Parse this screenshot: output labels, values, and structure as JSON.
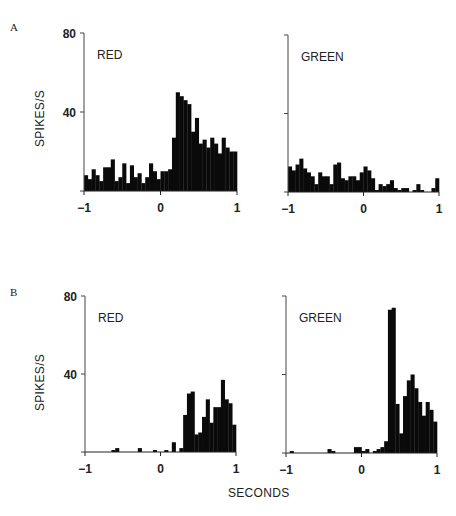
{
  "figure": {
    "panel_labels": [
      "A",
      "B"
    ],
    "ylabel": "SPIKES/S",
    "xlabel": "SECONDS"
  },
  "chart_data": [
    {
      "type": "bar",
      "panel": "A",
      "title": "RED",
      "xlabel": "",
      "ylabel": "SPIKES/S",
      "xlim": [
        -1,
        1
      ],
      "ylim": [
        0,
        80
      ],
      "xticks": [
        "-1",
        "0",
        "1"
      ],
      "yticks": [
        "80",
        "40"
      ],
      "bin_width": 0.05,
      "x": [
        -1.0,
        -0.95,
        -0.9,
        -0.85,
        -0.8,
        -0.75,
        -0.7,
        -0.65,
        -0.6,
        -0.55,
        -0.5,
        -0.45,
        -0.4,
        -0.35,
        -0.3,
        -0.25,
        -0.2,
        -0.15,
        -0.1,
        -0.05,
        0.0,
        0.05,
        0.1,
        0.15,
        0.2,
        0.25,
        0.3,
        0.35,
        0.4,
        0.45,
        0.5,
        0.55,
        0.6,
        0.65,
        0.7,
        0.75,
        0.8,
        0.85,
        0.9,
        0.95
      ],
      "values": [
        8,
        6,
        11,
        8,
        5,
        12,
        12,
        16,
        5,
        7,
        14,
        4,
        13,
        7,
        9,
        4,
        7,
        14,
        10,
        6,
        10,
        10,
        11,
        27,
        50,
        48,
        46,
        44,
        30,
        37,
        24,
        26,
        22,
        27,
        24,
        19,
        27,
        22,
        20,
        20
      ]
    },
    {
      "type": "bar",
      "panel": "A",
      "title": "GREEN",
      "xlabel": "",
      "ylabel": "",
      "xlim": [
        -1,
        1
      ],
      "ylim": [
        0,
        80
      ],
      "xticks": [
        "-1",
        "0",
        "1"
      ],
      "yticks": [],
      "bin_width": 0.05,
      "x": [
        -1.0,
        -0.95,
        -0.9,
        -0.85,
        -0.8,
        -0.75,
        -0.7,
        -0.65,
        -0.6,
        -0.55,
        -0.5,
        -0.45,
        -0.4,
        -0.35,
        -0.3,
        -0.25,
        -0.2,
        -0.15,
        -0.1,
        -0.05,
        0.0,
        0.05,
        0.1,
        0.15,
        0.2,
        0.25,
        0.3,
        0.35,
        0.4,
        0.45,
        0.5,
        0.55,
        0.6,
        0.65,
        0.7,
        0.75,
        0.8,
        0.85,
        0.9,
        0.95
      ],
      "values": [
        13,
        11,
        14,
        17,
        12,
        10,
        8,
        4,
        10,
        8,
        8,
        4,
        14,
        15,
        7,
        6,
        8,
        8,
        6,
        10,
        13,
        11,
        7,
        1,
        4,
        3,
        4,
        6,
        2,
        1,
        2,
        2,
        0,
        1,
        4,
        1,
        0,
        0,
        2,
        7
      ]
    },
    {
      "type": "bar",
      "panel": "B",
      "title": "RED",
      "xlabel": "",
      "ylabel": "SPIKES/S",
      "xlim": [
        -1,
        1
      ],
      "ylim": [
        0,
        80
      ],
      "xticks": [
        "-1",
        "0",
        "1"
      ],
      "yticks": [
        "80",
        "40"
      ],
      "bin_width": 0.05,
      "x": [
        -1.0,
        -0.95,
        -0.9,
        -0.85,
        -0.8,
        -0.75,
        -0.7,
        -0.65,
        -0.6,
        -0.55,
        -0.5,
        -0.45,
        -0.4,
        -0.35,
        -0.3,
        -0.25,
        -0.2,
        -0.15,
        -0.1,
        -0.05,
        0.0,
        0.05,
        0.1,
        0.15,
        0.2,
        0.25,
        0.3,
        0.35,
        0.4,
        0.45,
        0.5,
        0.55,
        0.6,
        0.65,
        0.7,
        0.75,
        0.8,
        0.85,
        0.9,
        0.95
      ],
      "values": [
        0,
        0,
        0,
        0,
        0,
        0,
        0,
        1,
        2,
        0,
        0,
        0,
        0,
        0,
        2,
        0,
        0,
        0,
        1,
        0,
        0,
        1,
        0,
        5,
        0,
        2,
        19,
        30,
        31,
        9,
        10,
        18,
        27,
        15,
        23,
        23,
        37,
        27,
        25,
        14
      ]
    },
    {
      "type": "bar",
      "panel": "B",
      "title": "GREEN",
      "xlabel": "SECONDS",
      "ylabel": "",
      "xlim": [
        -1,
        1
      ],
      "ylim": [
        0,
        80
      ],
      "xticks": [
        "-1",
        "0",
        "1"
      ],
      "yticks": [],
      "bin_width": 0.05,
      "x": [
        -1.0,
        -0.95,
        -0.9,
        -0.85,
        -0.8,
        -0.75,
        -0.7,
        -0.65,
        -0.6,
        -0.55,
        -0.5,
        -0.45,
        -0.4,
        -0.35,
        -0.3,
        -0.25,
        -0.2,
        -0.15,
        -0.1,
        -0.05,
        0.0,
        0.05,
        0.1,
        0.15,
        0.2,
        0.25,
        0.3,
        0.35,
        0.4,
        0.45,
        0.5,
        0.55,
        0.6,
        0.65,
        0.7,
        0.75,
        0.8,
        0.85,
        0.9,
        0.95
      ],
      "values": [
        0,
        1,
        0,
        0,
        0,
        0,
        0,
        0,
        0,
        0,
        0,
        2,
        1,
        0,
        0,
        0,
        0,
        0,
        3,
        3,
        1,
        2,
        0,
        1,
        2,
        3,
        6,
        73,
        74,
        25,
        10,
        29,
        37,
        40,
        33,
        26,
        19,
        26,
        22,
        16
      ]
    }
  ]
}
